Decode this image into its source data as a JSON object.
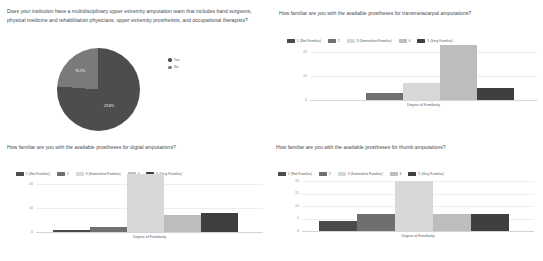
{
  "colors": {
    "cat1": "#4a4a4a",
    "cat2": "#6f6f6f",
    "cat3": "#d8d8d8",
    "cat4": "#bdbdbd",
    "cat5": "#3f3f3f",
    "pie_yes": "#4d4d4d",
    "pie_no": "#7a7a7a",
    "gridline": "#eceff1",
    "axis": "#d2d5d8",
    "text": "#44484c",
    "tick": "#8a8e92"
  },
  "familiarity_legend": [
    {
      "label": "1 (Not Familiar)",
      "color_key": "cat1"
    },
    {
      "label": "2",
      "color_key": "cat2"
    },
    {
      "label": "3 (Somewhat Familiar)",
      "color_key": "cat3"
    },
    {
      "label": "4",
      "color_key": "cat4"
    },
    {
      "label": "5 (Very Familiar)",
      "color_key": "cat5"
    }
  ],
  "panels": {
    "team": {
      "question": "Does your institution have a multidisciplinary upper extremity amputation team that includes hand surgeons, physical medicine and rehabilitation physicians, upper extremity prosthetists, and occupational therapists?",
      "slice_labels": [
        "76.2%",
        "23.8%"
      ],
      "legend": [
        {
          "label": "Yes",
          "color_key": "pie_yes"
        },
        {
          "label": "No",
          "color_key": "pie_no"
        }
      ]
    },
    "transmetacarpal": {
      "question": "How familiar are you with the available prostheses for transmetacarpal amputations?"
    },
    "digital": {
      "question": "How familiar are you with the available prostheses for digital amputations?"
    },
    "thumb": {
      "question": "How familiar are you with the available prostheses for thumb amputations?"
    }
  },
  "chart_data": [
    {
      "id": "team-pie",
      "type": "pie",
      "title": "Does your institution have a multidisciplinary upper extremity amputation team that includes hand surgeons, physical medicine and rehabilitation physicians, upper extremity prosthetists, and occupational therapists?",
      "labels": [
        "Yes",
        "No"
      ],
      "values": [
        76.2,
        23.8
      ],
      "value_labels": [
        "76.2%",
        "23.8%"
      ],
      "legend_position": "right",
      "colors": [
        "#4d4d4d",
        "#7a7a7a"
      ]
    },
    {
      "id": "transmetacarpal-bar",
      "type": "bar",
      "title": "How familiar are you with the available prostheses for transmetacarpal amputations?",
      "categories": [
        "1 (Not Familiar)",
        "2",
        "3 (Somewhat Familiar)",
        "4",
        "5 (Very Familiar)"
      ],
      "values": [
        0,
        3,
        7,
        23,
        5
      ],
      "values_note": "bar 5 split visual: 5 then 4 (Very Familiar) segment at 4",
      "xlabel": "Degree of Familiarity",
      "ylabel": "",
      "ylim": [
        0,
        24
      ],
      "yticks": [
        0,
        10,
        20
      ],
      "grid": true,
      "legend_position": "top",
      "colors": [
        "#4a4a4a",
        "#6f6f6f",
        "#d8d8d8",
        "#bdbdbd",
        "#3f3f3f"
      ]
    },
    {
      "id": "digital-bar",
      "type": "bar",
      "title": "How familiar are you with the available prostheses for digital amputations?",
      "categories": [
        "1 (Not Familiar)",
        "2",
        "3 (Somewhat Familiar)",
        "4",
        "5 (Very Familiar)"
      ],
      "values": [
        1,
        2,
        24,
        7,
        8
      ],
      "xlabel": "Degree of Familiarity",
      "ylabel": "",
      "ylim": [
        0,
        25
      ],
      "yticks": [
        0,
        10,
        20
      ],
      "grid": true,
      "legend_position": "top",
      "colors": [
        "#4a4a4a",
        "#6f6f6f",
        "#d8d8d8",
        "#bdbdbd",
        "#3f3f3f"
      ]
    },
    {
      "id": "thumb-bar",
      "type": "bar",
      "title": "How familiar are you with the available prostheses for thumb amputations?",
      "categories": [
        "1 (Not Familiar)",
        "2",
        "3 (Somewhat Familiar)",
        "4",
        "5 (Very Familiar)"
      ],
      "values": [
        4,
        7,
        20,
        7,
        7
      ],
      "xlabel": "Degree of Familiarity",
      "ylabel": "",
      "ylim": [
        0,
        21
      ],
      "yticks": [
        0,
        5,
        10,
        15,
        20
      ],
      "grid": true,
      "legend_position": "top",
      "colors": [
        "#4a4a4a",
        "#6f6f6f",
        "#d8d8d8",
        "#bdbdbd",
        "#3f3f3f"
      ]
    }
  ]
}
